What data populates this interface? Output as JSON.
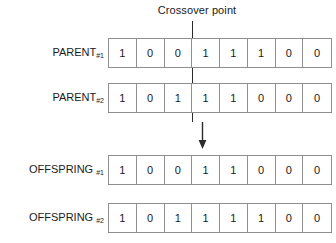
{
  "diagram": {
    "title": "Crossover point",
    "crossover_point_index": 3,
    "bit_length": 8,
    "arrow_icon": "down-arrow-icon",
    "line_color": "#2b2b2b",
    "cell_border_color": "#8f8f8f",
    "text_color": "#1a1a1a",
    "background": "#ffffff",
    "rows": [
      {
        "id": "parent-1",
        "label_main": "PARENT",
        "label_sub": "#1",
        "label_space": "",
        "bits": [
          "1",
          "0",
          "0",
          "1",
          "1",
          "1",
          "0",
          "0"
        ],
        "top": 38
      },
      {
        "id": "parent-2",
        "label_main": "PARENT",
        "label_sub": "#2",
        "label_space": "",
        "bits": [
          "1",
          "0",
          "1",
          "1",
          "1",
          "0",
          "0",
          "0"
        ],
        "top": 83
      },
      {
        "id": "offspring-1",
        "label_main": "OFFSPRING",
        "label_sub": "#1",
        "label_space": " ",
        "bits": [
          "1",
          "0",
          "0",
          "1",
          "1",
          "0",
          "0",
          "0"
        ],
        "top": 155
      },
      {
        "id": "offspring-2",
        "label_main": "OFFSPRING",
        "label_sub": "#2",
        "label_space": " ",
        "bits": [
          "1",
          "0",
          "1",
          "1",
          "1",
          "1",
          "0",
          "0"
        ],
        "top": 203
      }
    ]
  }
}
